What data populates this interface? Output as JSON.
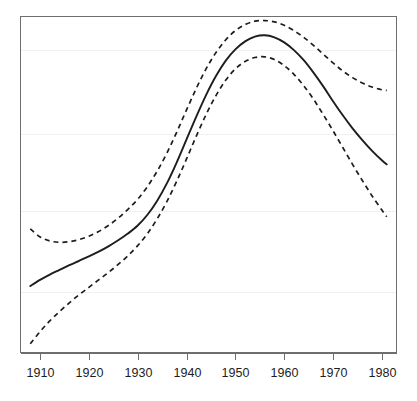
{
  "chart_data": {
    "type": "line",
    "title": "",
    "subtitle": "",
    "xlabel": "",
    "ylabel": "",
    "xlim": [
      1906,
      1983
    ],
    "ylim": [
      0,
      100
    ],
    "grid": true,
    "grid_axis": "y",
    "gridline_values": [
      90,
      65,
      42,
      18
    ],
    "legend": "none",
    "x_ticks": [
      1910,
      1920,
      1930,
      1940,
      1950,
      1960,
      1970,
      1980
    ],
    "x_tick_labels": [
      "1910",
      "1920",
      "1930",
      "1940",
      "1950",
      "1960",
      "1970",
      "1980"
    ],
    "y_ticks": [],
    "y_tick_labels": [],
    "x": [
      1908,
      1910,
      1912,
      1914,
      1916,
      1918,
      1920,
      1922,
      1924,
      1926,
      1928,
      1930,
      1932,
      1934,
      1936,
      1938,
      1940,
      1942,
      1944,
      1946,
      1948,
      1950,
      1952,
      1954,
      1956,
      1958,
      1960,
      1962,
      1964,
      1966,
      1968,
      1970,
      1972,
      1974,
      1976,
      1978,
      1980,
      1981
    ],
    "series": [
      {
        "name": "fitted",
        "style": "solid",
        "values": [
          19.8,
          21.6,
          23.2,
          24.6,
          26.0,
          27.3,
          28.6,
          30.0,
          31.6,
          33.4,
          35.4,
          37.8,
          41.0,
          45.2,
          50.4,
          56.6,
          63.4,
          70.2,
          76.6,
          82.2,
          86.8,
          90.2,
          92.6,
          94.0,
          94.4,
          93.8,
          92.3,
          90.0,
          87.0,
          83.3,
          79.2,
          74.8,
          70.6,
          66.7,
          63.2,
          60.0,
          57.2,
          56.0
        ]
      },
      {
        "name": "upper confidence limit",
        "style": "dashed",
        "values": [
          36.8,
          34.4,
          33.2,
          32.8,
          33.0,
          33.6,
          34.6,
          36.0,
          37.8,
          40.0,
          42.6,
          45.6,
          49.4,
          54.0,
          59.4,
          65.6,
          72.2,
          78.6,
          84.4,
          89.2,
          93.0,
          95.8,
          97.6,
          98.6,
          98.8,
          98.4,
          97.4,
          95.8,
          93.8,
          91.4,
          88.8,
          86.2,
          83.8,
          81.8,
          80.2,
          79.0,
          78.2,
          78.0
        ]
      },
      {
        "name": "lower confidence limit",
        "style": "dashed",
        "values": [
          2.6,
          6.2,
          9.4,
          12.2,
          14.8,
          17.2,
          19.4,
          21.6,
          23.8,
          26.2,
          28.8,
          31.8,
          35.4,
          39.8,
          45.0,
          51.0,
          57.6,
          64.4,
          70.8,
          76.4,
          81.0,
          84.4,
          86.6,
          87.8,
          88.0,
          87.2,
          85.4,
          82.8,
          79.4,
          75.4,
          70.8,
          66.0,
          61.0,
          56.0,
          51.2,
          46.6,
          42.4,
          40.4
        ]
      }
    ]
  },
  "figure": {
    "background_color": "#ffffff",
    "line_color": "#1d1d1d",
    "frame_color": "#6e6e6e",
    "grid_color": "#f1f1f1"
  }
}
